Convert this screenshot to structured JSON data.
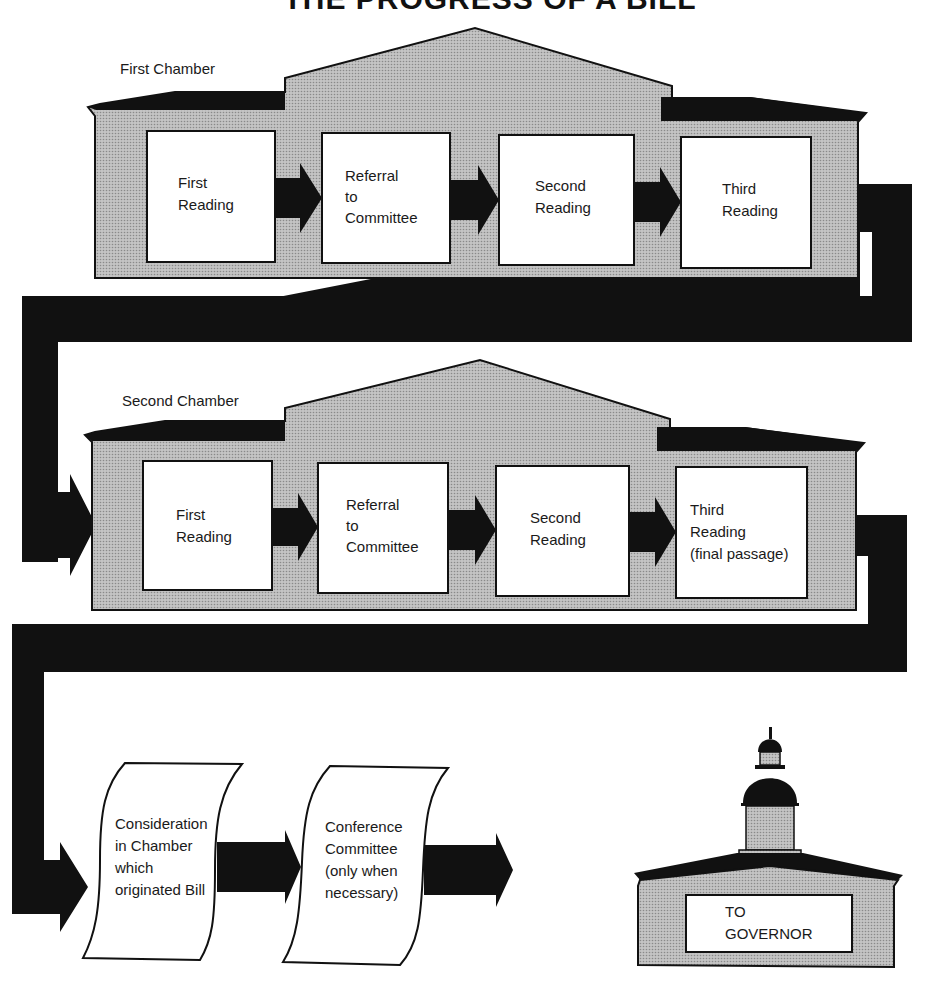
{
  "title": "THE PROGRESS OF A BILL",
  "colors": {
    "ink": "#111111",
    "chamber_fill": "#b8b8b8",
    "box_fill": "#ffffff",
    "background": "#ffffff"
  },
  "first_chamber": {
    "label": "First Chamber",
    "steps": [
      {
        "lines": [
          "First",
          "Reading"
        ]
      },
      {
        "lines": [
          "Referral",
          "to",
          "Committee"
        ]
      },
      {
        "lines": [
          "Second",
          "Reading"
        ]
      },
      {
        "lines": [
          "Third",
          "Reading"
        ]
      }
    ]
  },
  "second_chamber": {
    "label": "Second Chamber",
    "steps": [
      {
        "lines": [
          "First",
          "Reading"
        ]
      },
      {
        "lines": [
          "Referral",
          "to",
          "Committee"
        ]
      },
      {
        "lines": [
          "Second",
          "Reading"
        ]
      },
      {
        "lines": [
          "Third",
          "Reading",
          "(final passage)"
        ]
      }
    ]
  },
  "final_steps": [
    {
      "lines": [
        "Consideration",
        "in Chamber",
        "which",
        "originated Bill"
      ]
    },
    {
      "lines": [
        "Conference",
        "Committee",
        "(only when",
        "necessary)"
      ]
    }
  ],
  "governor": {
    "lines": [
      "TO",
      "GOVERNOR"
    ]
  }
}
